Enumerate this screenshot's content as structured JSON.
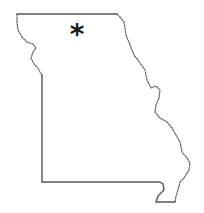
{
  "map": {
    "region": "Missouri",
    "outline_color": "#555555",
    "background": "#ffffff",
    "marker": {
      "symbol": "*",
      "icon": "asterisk-icon",
      "color": "#1a1a1a",
      "x": 77,
      "y": 35
    }
  }
}
